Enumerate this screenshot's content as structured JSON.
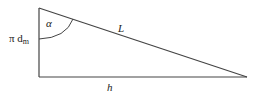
{
  "diagram": {
    "type": "right-triangle",
    "labels": {
      "angle": "α",
      "vertical_side_main": "π d",
      "vertical_side_sub": "m",
      "hypotenuse": "L",
      "base": "h"
    },
    "colors": {
      "line": "#444444",
      "text": "#222222",
      "background": "#ffffff"
    }
  }
}
